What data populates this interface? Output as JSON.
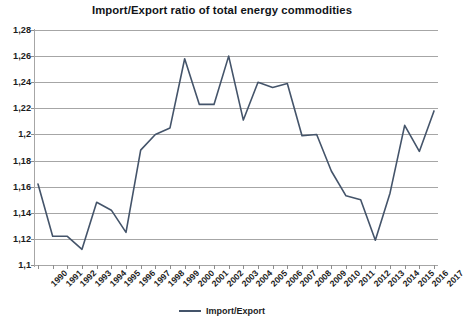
{
  "chart_data": {
    "type": "line",
    "title": "Import/Export ratio of total energy commodities",
    "xlabel": "",
    "ylabel": "",
    "ylim": [
      1.1,
      1.28
    ],
    "ytick_step": 0.02,
    "decimal_separator": ",",
    "grid": true,
    "legend_position": "bottom",
    "line_color": "#44546a",
    "grid_color": "#a6a6a6",
    "ytick_labels": [
      "1,28",
      "1,26",
      "1,24",
      "1,22",
      "1,2",
      "1,18",
      "1,16",
      "1,14",
      "1,12",
      "1,1"
    ],
    "ytick_values": [
      1.28,
      1.26,
      1.24,
      1.22,
      1.2,
      1.18,
      1.16,
      1.14,
      1.12,
      1.1
    ],
    "categories": [
      "1990",
      "1991",
      "1992",
      "1993",
      "1994",
      "1995",
      "1996",
      "1997",
      "1998",
      "1999",
      "2000",
      "2001",
      "2002",
      "2003",
      "2004",
      "2005",
      "2006",
      "2007",
      "2008",
      "2009",
      "2010",
      "2011",
      "2012",
      "2013",
      "2014",
      "2015",
      "2016",
      "2017"
    ],
    "series": [
      {
        "name": "Import/Export",
        "values": [
          1.162,
          1.122,
          1.122,
          1.112,
          1.148,
          1.142,
          1.125,
          1.188,
          1.2,
          1.205,
          1.258,
          1.223,
          1.223,
          1.26,
          1.211,
          1.24,
          1.236,
          1.239,
          1.199,
          1.2,
          1.172,
          1.153,
          1.15,
          1.119,
          1.155,
          1.207,
          1.187,
          1.218
        ]
      }
    ],
    "legend": [
      "Import/Export"
    ]
  }
}
